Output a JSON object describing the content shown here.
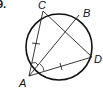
{
  "problem": {
    "number": "9."
  },
  "diagram": {
    "points": [
      {
        "name": "A",
        "x": 29,
        "y": 76
      },
      {
        "name": "C",
        "x": 43,
        "y": 11
      },
      {
        "name": "B",
        "x": 79,
        "y": 15
      },
      {
        "name": "D",
        "x": 92,
        "y": 57
      }
    ],
    "labels": {
      "A": "A",
      "B": "B",
      "C": "C",
      "D": "D"
    },
    "circle": {
      "cx": 59,
      "cy": 47,
      "r": 33
    },
    "segments": [
      "AC",
      "AB",
      "AD",
      "CD"
    ],
    "congruent_marks": [
      "AC",
      "AD"
    ],
    "angle_marks": [
      "CAB",
      "BAD"
    ]
  }
}
